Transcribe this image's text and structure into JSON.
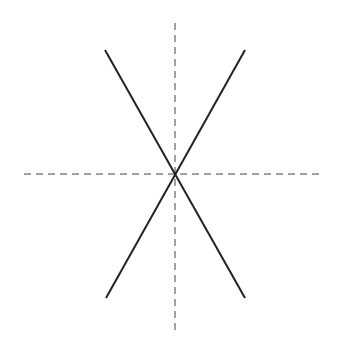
{
  "diagram": {
    "colors": {
      "solid_line": "#222222",
      "dashed_axis": "#444444",
      "background": "#ffffff"
    },
    "elements": [
      {
        "name": "line-descending",
        "style": "solid"
      },
      {
        "name": "line-ascending",
        "style": "solid"
      },
      {
        "name": "horizontal-axis",
        "style": "dashed"
      },
      {
        "name": "vertical-axis",
        "style": "dashed"
      }
    ]
  }
}
